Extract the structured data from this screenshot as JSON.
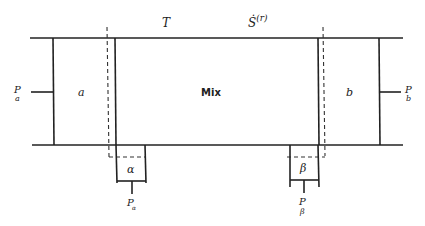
{
  "diagram": {
    "type": "thermodynamic-mixing-system",
    "top_labels": {
      "temperature": "T",
      "entropy_production": "Ṡ",
      "entropy_production_superscript": "(r)"
    },
    "regions": {
      "left_reservoir": "a",
      "center": "Mix",
      "right_reservoir": "b",
      "left_outlet": "α",
      "right_outlet": "β"
    },
    "pressures": {
      "left": {
        "symbol": "P",
        "subscript": "a"
      },
      "right": {
        "symbol": "P",
        "subscript": "b"
      },
      "alpha": {
        "symbol": "P",
        "subscript": "α"
      },
      "beta": {
        "symbol": "P",
        "subscript": "β"
      }
    },
    "colors": {
      "line": "#222222",
      "background": "#ffffff"
    }
  }
}
